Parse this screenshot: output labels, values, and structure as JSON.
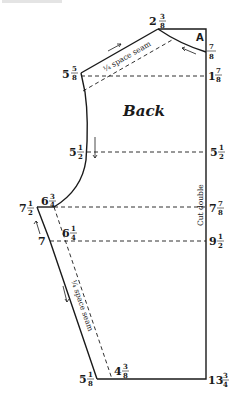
{
  "diagram": {
    "title": "Back",
    "corner_label": "A",
    "fold_note": "Cut double",
    "seam_note_top": "¼ space seam",
    "seam_note_side": "¼ space seam",
    "measurements": {
      "neck_top": {
        "whole": "2",
        "num": "3",
        "den": "8"
      },
      "neck_drop": {
        "whole": "",
        "num": "7",
        "den": "8"
      },
      "shoulder_left": {
        "whole": "5",
        "num": "5",
        "den": "8"
      },
      "shoulder_right": {
        "whole": "1",
        "num": "7",
        "den": "8"
      },
      "armhole_left": {
        "whole": "5",
        "num": "1",
        "den": "2"
      },
      "armhole_right": {
        "whole": "5",
        "num": "1",
        "den": "2"
      },
      "underarm_inner": {
        "whole": "6",
        "num": "3",
        "den": "4"
      },
      "underarm_outer": {
        "whole": "7",
        "num": "1",
        "den": "2"
      },
      "underarm_right": {
        "whole": "7",
        "num": "7",
        "den": "8"
      },
      "waist_left": {
        "whole": "7",
        "num": "",
        "den": ""
      },
      "waist_inner": {
        "whole": "6",
        "num": "1",
        "den": "4"
      },
      "waist_right": {
        "whole": "9",
        "num": "1",
        "den": "2"
      },
      "hem_left": {
        "whole": "5",
        "num": "1",
        "den": "8"
      },
      "hem_inner": {
        "whole": "4",
        "num": "3",
        "den": "8"
      },
      "hem_right": {
        "whole": "13",
        "num": "3",
        "den": "4"
      }
    },
    "colors": {
      "line": "#1a1a1a",
      "background": "#ffffff"
    }
  }
}
